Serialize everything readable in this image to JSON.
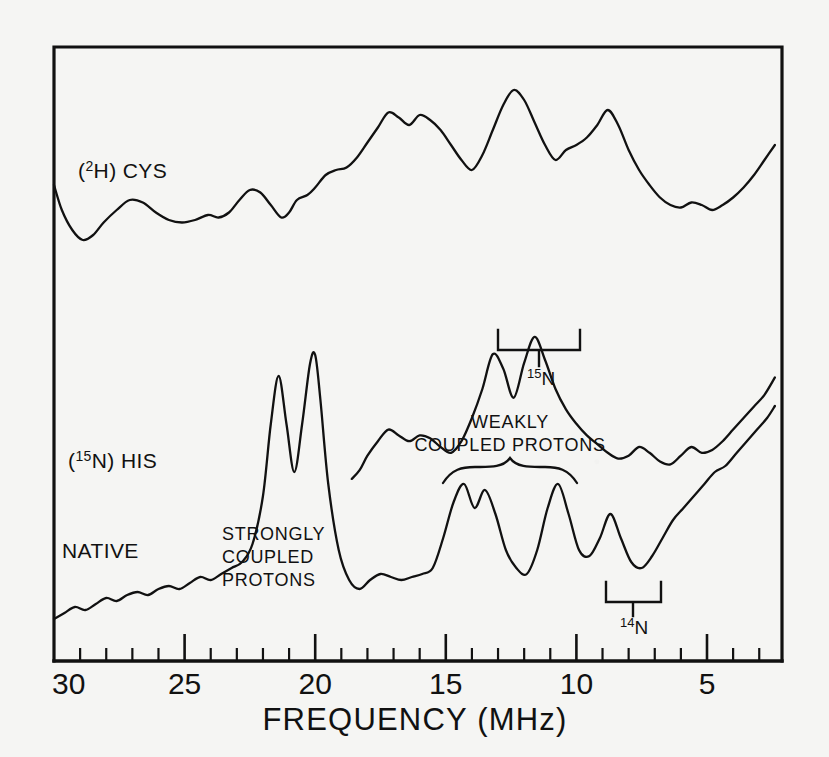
{
  "figure": {
    "kind": "endor-spectra",
    "background_color": "#f5f5f3",
    "ink_color": "#111111",
    "axis_title": "FREQUENCY (MHz)",
    "frame": {
      "left_px": 54,
      "right_px": 782,
      "top_px": 47,
      "bottom_px": 661
    }
  },
  "axis": {
    "label": "FREQUENCY (MHz)",
    "unit": "MHz",
    "reversed": true,
    "range": [
      30,
      2.4
    ],
    "major_ticks": [
      30,
      25,
      20,
      15,
      10,
      5
    ],
    "major_tick_labels": [
      "30",
      "25",
      "20",
      "15",
      "10",
      "5"
    ],
    "minor_tick_step": 1,
    "minor_ticks": [
      29,
      28,
      27,
      26,
      24,
      23,
      22,
      21,
      19,
      18,
      17,
      16,
      14,
      13,
      12,
      11,
      9,
      8,
      7,
      6,
      4,
      3
    ]
  },
  "traces": [
    {
      "id": "deuterated-cys",
      "label": "(2H) CYS",
      "label_parts": {
        "open": "(",
        "sup": "2",
        "mid": "H) CYS",
        "close": ""
      },
      "label_pos": {
        "x": 78,
        "y": 172
      },
      "description": "Top ENDOR trace of the 2H-labelled cysteine sample"
    },
    {
      "id": "n15-his",
      "label": "(15N) HIS",
      "label_parts": {
        "open": "(",
        "sup": "15",
        "mid": "N) HIS",
        "close": ""
      },
      "label_pos": {
        "x": 68,
        "y": 462
      },
      "description": "Middle ENDOR trace of the 15N-labelled histidine sample"
    },
    {
      "id": "native",
      "label": "NATIVE",
      "label_pos": {
        "x": 62,
        "y": 552
      },
      "description": "Bottom ENDOR trace of the native (unlabelled) protein"
    }
  ],
  "annotations": [
    {
      "id": "strongly-coupled-protons",
      "lines": [
        "STRONGLY",
        "COUPLED",
        "PROTONS"
      ],
      "pos": {
        "x": 222,
        "y": 540
      },
      "has_bracket": false
    },
    {
      "id": "weakly-coupled-protons",
      "lines": [
        "WEAKLY",
        "COUPLED PROTONS"
      ],
      "pos": {
        "x": 510,
        "y": 428
      },
      "has_bracket": true,
      "brace_span_mhz": [
        15.6,
        11.4
      ]
    },
    {
      "id": "nitrogen-15-bracket",
      "label": "15N",
      "label_parts": {
        "sup": "15",
        "main": "N"
      },
      "pos": {
        "x": 540,
        "y": 375
      },
      "bracket_span_mhz": [
        13.2,
        10.3
      ],
      "bracket_y_px": 330
    },
    {
      "id": "nitrogen-14-bracket",
      "label": "14N",
      "label_parts": {
        "sup": "14",
        "main": "N"
      },
      "pos": {
        "x": 648,
        "y": 625
      },
      "bracket_span_mhz": [
        9.3,
        7.2
      ],
      "bracket_y_px": 582
    }
  ],
  "chart_data": {
    "type": "line",
    "title": "",
    "subtitle": "",
    "xlabel": "FREQUENCY (MHz)",
    "ylabel": "",
    "xlim": [
      30,
      2.4
    ],
    "x_reversed": true,
    "ylim": [
      0,
      1
    ],
    "grid": false,
    "legend": "inline-labels",
    "legend_position": "in-plot-left",
    "tick_labels_x": [
      "30",
      "25",
      "20",
      "15",
      "10",
      "5"
    ],
    "series": [
      {
        "name": "(2H) CYS",
        "comment": "top trace; x in MHz, y in arbitrary ENDOR intensity units (baseline ~0)",
        "x": [
          30.0,
          29.7,
          29.3,
          28.9,
          28.5,
          28.1,
          27.6,
          27.1,
          26.6,
          26.1,
          25.6,
          25.1,
          24.6,
          24.1,
          23.7,
          23.3,
          22.9,
          22.5,
          22.1,
          21.7,
          21.3,
          21.0,
          20.7,
          20.3,
          20.0,
          19.6,
          19.2,
          18.8,
          18.4,
          18.0,
          17.6,
          17.2,
          16.8,
          16.4,
          16.0,
          15.6,
          15.2,
          14.8,
          14.4,
          14.0,
          13.6,
          13.2,
          12.8,
          12.4,
          12.0,
          11.6,
          11.2,
          10.8,
          10.4,
          10.0,
          9.6,
          9.2,
          8.8,
          8.4,
          8.0,
          7.6,
          7.2,
          6.8,
          6.4,
          6.0,
          5.6,
          5.2,
          4.8,
          4.4,
          4.0,
          3.6,
          3.2,
          2.8,
          2.4
        ],
        "y": [
          0.46,
          0.36,
          0.28,
          0.24,
          0.26,
          0.31,
          0.36,
          0.4,
          0.39,
          0.35,
          0.32,
          0.31,
          0.32,
          0.34,
          0.33,
          0.35,
          0.4,
          0.44,
          0.43,
          0.38,
          0.33,
          0.35,
          0.4,
          0.42,
          0.45,
          0.5,
          0.52,
          0.53,
          0.57,
          0.63,
          0.69,
          0.75,
          0.73,
          0.7,
          0.74,
          0.72,
          0.68,
          0.62,
          0.56,
          0.52,
          0.58,
          0.68,
          0.78,
          0.84,
          0.8,
          0.71,
          0.62,
          0.56,
          0.6,
          0.62,
          0.65,
          0.7,
          0.76,
          0.7,
          0.6,
          0.52,
          0.46,
          0.41,
          0.38,
          0.37,
          0.39,
          0.38,
          0.36,
          0.38,
          0.41,
          0.45,
          0.5,
          0.56,
          0.62
        ]
      },
      {
        "name": "(15N) HIS",
        "comment": "middle trace; prominent weakly coupled proton peaks near 13 and 12 MHz",
        "x": [
          18.6,
          18.3,
          18.0,
          17.6,
          17.2,
          16.8,
          16.4,
          16.0,
          15.6,
          15.2,
          14.8,
          14.4,
          14.0,
          13.6,
          13.2,
          12.8,
          12.4,
          12.0,
          11.6,
          11.2,
          10.8,
          10.4,
          10.0,
          9.6,
          9.2,
          8.8,
          8.4,
          8.0,
          7.6,
          7.2,
          6.8,
          6.4,
          6.0,
          5.6,
          5.2,
          4.8,
          4.4,
          4.0,
          3.6,
          3.2,
          2.8,
          2.4
        ],
        "y": [
          0.09,
          0.12,
          0.17,
          0.22,
          0.26,
          0.24,
          0.22,
          0.24,
          0.23,
          0.2,
          0.18,
          0.22,
          0.3,
          0.4,
          0.52,
          0.47,
          0.37,
          0.49,
          0.58,
          0.5,
          0.4,
          0.33,
          0.28,
          0.24,
          0.21,
          0.18,
          0.16,
          0.17,
          0.2,
          0.18,
          0.15,
          0.14,
          0.17,
          0.2,
          0.18,
          0.19,
          0.22,
          0.26,
          0.3,
          0.34,
          0.38,
          0.44
        ]
      },
      {
        "name": "NATIVE",
        "comment": "bottom trace; two sharp strongly coupled proton peaks at ~21.3 and ~20.0 MHz, weakly coupled doublet near 14.2/13.3, and peaks at 10.8, 8.6",
        "x": [
          30.0,
          29.6,
          29.2,
          28.8,
          28.4,
          28.0,
          27.6,
          27.2,
          26.8,
          26.4,
          26.0,
          25.6,
          25.2,
          24.8,
          24.4,
          24.0,
          23.6,
          23.2,
          22.8,
          22.4,
          22.0,
          21.7,
          21.4,
          21.1,
          20.8,
          20.5,
          20.2,
          20.0,
          19.8,
          19.5,
          19.1,
          18.7,
          18.3,
          17.9,
          17.5,
          17.1,
          16.7,
          16.3,
          15.9,
          15.5,
          15.1,
          14.7,
          14.3,
          13.9,
          13.5,
          13.1,
          12.7,
          12.3,
          11.9,
          11.5,
          11.1,
          10.7,
          10.3,
          9.9,
          9.5,
          9.1,
          8.7,
          8.3,
          7.9,
          7.5,
          7.1,
          6.7,
          6.3,
          5.9,
          5.5,
          5.1,
          4.7,
          4.3,
          3.9,
          3.5,
          3.1,
          2.7,
          2.4
        ],
        "y": [
          0.07,
          0.09,
          0.11,
          0.1,
          0.12,
          0.14,
          0.13,
          0.15,
          0.16,
          0.15,
          0.17,
          0.18,
          0.17,
          0.19,
          0.21,
          0.2,
          0.22,
          0.24,
          0.26,
          0.32,
          0.48,
          0.72,
          0.88,
          0.72,
          0.56,
          0.72,
          0.92,
          0.95,
          0.8,
          0.52,
          0.3,
          0.2,
          0.17,
          0.2,
          0.22,
          0.21,
          0.2,
          0.21,
          0.22,
          0.24,
          0.34,
          0.46,
          0.52,
          0.44,
          0.5,
          0.42,
          0.3,
          0.24,
          0.22,
          0.3,
          0.44,
          0.52,
          0.42,
          0.3,
          0.28,
          0.34,
          0.42,
          0.34,
          0.26,
          0.24,
          0.28,
          0.34,
          0.4,
          0.44,
          0.48,
          0.52,
          0.56,
          0.58,
          0.62,
          0.66,
          0.7,
          0.74,
          0.78
        ]
      }
    ],
    "marked_regions": [
      {
        "label": "STRONGLY COUPLED PROTONS",
        "span_mhz": [
          22.5,
          19.0
        ],
        "series": "NATIVE"
      },
      {
        "label": "WEAKLY COUPLED PROTONS",
        "span_mhz": [
          15.6,
          11.4
        ],
        "series": "NATIVE"
      },
      {
        "label": "15N",
        "span_mhz": [
          13.2,
          10.3
        ],
        "series": "(15N) HIS"
      },
      {
        "label": "14N",
        "span_mhz": [
          9.3,
          7.2
        ],
        "series": "NATIVE"
      }
    ]
  }
}
